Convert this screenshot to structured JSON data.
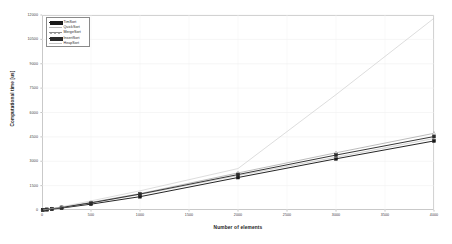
{
  "chart_data": {
    "type": "line",
    "title": "",
    "xlabel": "Number of elements",
    "ylabel": "Computational time [us]",
    "xlim": [
      0,
      4000
    ],
    "ylim": [
      0,
      12000
    ],
    "grid": true,
    "legend_position": "top-left-inside",
    "xticks": [
      0,
      500,
      1000,
      1500,
      2000,
      2500,
      3000,
      3500,
      4000
    ],
    "xtick_labels": [
      "0",
      "500",
      "1000",
      "1500",
      "2000",
      "2500",
      "3000",
      "3500",
      "4000"
    ],
    "yticks": [
      0,
      1500,
      3000,
      4500,
      6000,
      7500,
      9000,
      10500,
      12000
    ],
    "ytick_labels": [
      "0",
      "1500",
      "3000",
      "4500",
      "6000",
      "7500",
      "9000",
      "10500",
      "12000"
    ],
    "x": [
      10,
      50,
      100,
      200,
      500,
      1000,
      2000,
      3000,
      4000
    ],
    "series": [
      {
        "name": "TimSort",
        "color": "#1a1a1a",
        "marker": "square",
        "marker_filled": true,
        "values": [
          5,
          25,
          55,
          120,
          360,
          820,
          2000,
          3150,
          4250
        ]
      },
      {
        "name": "QuickSort",
        "color": "#b8b8b8",
        "marker": "none",
        "marker_filled": false,
        "values": [
          6,
          30,
          70,
          150,
          430,
          950,
          2120,
          3250,
          4400
        ]
      },
      {
        "name": "MergeSort",
        "color": "#8f8f8f",
        "marker": "triangle",
        "marker_filled": false,
        "values": [
          7,
          35,
          78,
          170,
          470,
          1010,
          2280,
          3520,
          4720
        ]
      },
      {
        "name": "InsertSort",
        "color": "#2b2b2b",
        "marker": "square",
        "marker_filled": true,
        "values": [
          6,
          32,
          72,
          158,
          440,
          980,
          2180,
          3380,
          4520
        ]
      },
      {
        "name": "HeapSort",
        "color": "#c6c6c6",
        "marker": "none",
        "marker_filled": false,
        "values": [
          8,
          40,
          90,
          200,
          560,
          1180,
          2550,
          7100,
          11800
        ]
      }
    ]
  }
}
